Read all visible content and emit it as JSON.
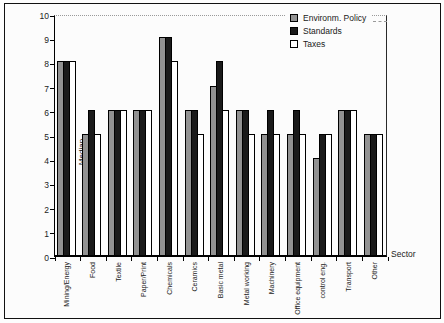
{
  "chart_data": {
    "type": "bar",
    "title": "",
    "xlabel": "Sector",
    "ylabel": "Median",
    "ylim": [
      0,
      10
    ],
    "yticks": [
      0,
      1,
      2,
      3,
      4,
      5,
      6,
      7,
      8,
      9,
      10
    ],
    "grid": "single dotted gridline at y=10 only",
    "legend_position": "top-right inside plot",
    "categories": [
      "Mining/Energy",
      "Food",
      "Textile",
      "Paper/Print",
      "Chemicals",
      "Ceramics",
      "Basic metal",
      "Metal working",
      "Machinery",
      "Office equipment",
      "control eng.",
      "Transport",
      "Other"
    ],
    "series": [
      {
        "name": "Environm. Policy",
        "color": "#929292",
        "values": [
          8,
          5,
          6,
          6,
          9,
          6,
          7,
          6,
          5,
          5,
          4,
          6,
          5
        ]
      },
      {
        "name": "Standards",
        "color": "#1a1a1a",
        "values": [
          8,
          6,
          6,
          6,
          9,
          6,
          8,
          6,
          6,
          6,
          5,
          6,
          5
        ]
      },
      {
        "name": "Taxes",
        "color": "#ffffff",
        "values": [
          8,
          5,
          6,
          6,
          8,
          5,
          6,
          5,
          5,
          5,
          5,
          6,
          5
        ]
      }
    ]
  },
  "colors": {
    "axis": "#000000",
    "figure_border": "#111111",
    "gridline": "#9a9a9a"
  }
}
